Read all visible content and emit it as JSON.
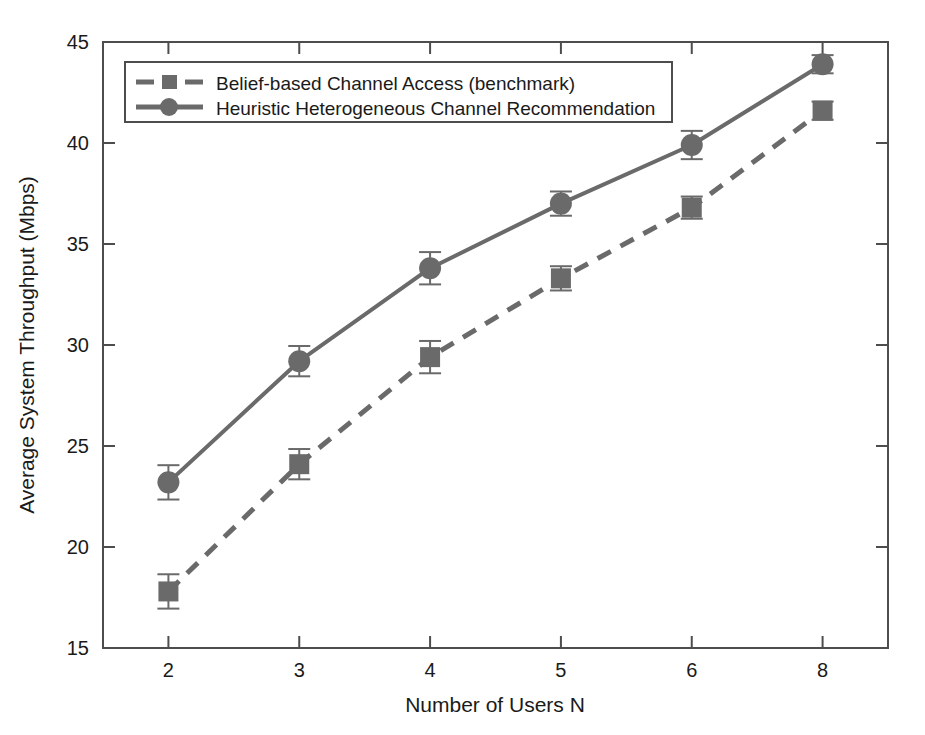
{
  "chart_data": {
    "type": "line",
    "title": "",
    "xlabel": "Number of Users N",
    "ylabel": "Average System Throughput (Mbps)",
    "categories": [
      "2",
      "3",
      "4",
      "5",
      "6",
      "8"
    ],
    "x": [
      2,
      3,
      4,
      5,
      6,
      8
    ],
    "xtick_labels": [
      "2",
      "3",
      "4",
      "5",
      "6",
      "8"
    ],
    "ytick_labels": [
      "15",
      "20",
      "25",
      "30",
      "35",
      "40",
      "45"
    ],
    "ytick_values": [
      15,
      20,
      25,
      30,
      35,
      40,
      45
    ],
    "ylim": [
      15,
      45
    ],
    "grid": false,
    "legend_position": "upper-left-inside",
    "series": [
      {
        "name": "Belief-based Channel Access (benchmark)",
        "style": "dashed",
        "marker": "square",
        "color": "#6a6a6a",
        "values": [
          17.8,
          24.1,
          29.4,
          33.3,
          36.8,
          41.6
        ],
        "error": [
          0.85,
          0.75,
          0.8,
          0.6,
          0.55,
          0.45
        ]
      },
      {
        "name": "Heuristic Heterogeneous Channel Recommendation",
        "style": "solid",
        "marker": "circle",
        "color": "#6a6a6a",
        "values": [
          23.2,
          29.2,
          33.8,
          37.0,
          39.9,
          43.9
        ],
        "error": [
          0.85,
          0.75,
          0.8,
          0.6,
          0.7,
          0.45
        ]
      }
    ]
  },
  "legend": {
    "entries": [
      {
        "label": "Belief-based Channel Access (benchmark)",
        "marker": "square-marker",
        "style": "dashed"
      },
      {
        "label": "Heuristic Heterogeneous Channel Recommendation",
        "marker": "circle-marker",
        "style": "solid"
      }
    ]
  },
  "colors": {
    "series": "#6a6a6a",
    "axis": "#4d4d4d",
    "text": "#1a1a1a",
    "background": "#ffffff"
  }
}
